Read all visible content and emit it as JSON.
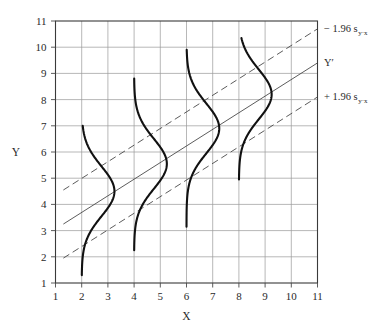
{
  "chart_data": {
    "type": "line",
    "title": "",
    "xlabel": "X",
    "ylabel": "Y",
    "xlim": [
      1,
      11
    ],
    "ylim": [
      1,
      11
    ],
    "xticks": [
      1,
      2,
      3,
      4,
      5,
      6,
      7,
      8,
      9,
      10,
      11
    ],
    "yticks": [
      1,
      2,
      3,
      4,
      5,
      6,
      7,
      8,
      9,
      10,
      11
    ],
    "grid": true,
    "legend_position": "right-outside",
    "series": [
      {
        "name": "upper_confidence_band",
        "label": "− 1.96 s",
        "label_sub": "y·x",
        "style": "dashed",
        "x": [
          1.3,
          11
        ],
        "y": [
          4.55,
          10.7
        ]
      },
      {
        "name": "regression_line",
        "label": "Y′",
        "label_sub": "",
        "style": "solid",
        "x": [
          1.3,
          11
        ],
        "y": [
          3.25,
          9.4
        ]
      },
      {
        "name": "lower_confidence_band",
        "label": "+ 1.96 s",
        "label_sub": "y·x",
        "style": "dashed",
        "x": [
          1.3,
          11
        ],
        "y": [
          1.95,
          8.1
        ]
      }
    ],
    "distributions": [
      {
        "name": "conditional-distribution-x2",
        "x": 2.0,
        "mean": 4.5,
        "sd": 0.95,
        "y_min": 1.3,
        "y_max": 7.0,
        "amplitude": 1.25
      },
      {
        "name": "conditional-distribution-x4",
        "x": 4.0,
        "mean": 5.55,
        "sd": 0.95,
        "y_min": 2.25,
        "y_max": 8.8,
        "amplitude": 1.25
      },
      {
        "name": "conditional-distribution-x6",
        "x": 6.0,
        "mean": 6.9,
        "sd": 0.95,
        "y_min": 3.15,
        "y_max": 9.9,
        "amplitude": 1.25
      },
      {
        "name": "conditional-distribution-x8",
        "x": 8.0,
        "mean": 8.2,
        "sd": 0.95,
        "y_min": 4.95,
        "y_max": 10.35,
        "amplitude": 1.25
      }
    ]
  },
  "colors": {
    "curve": "#111111",
    "grid": "#9a9a9a",
    "frame": "#3a3a3a",
    "line": "#4a4a4a",
    "background": "#ffffff"
  }
}
